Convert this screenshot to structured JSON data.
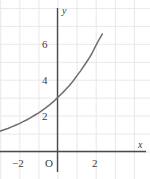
{
  "figure": {
    "corner_mark": "·",
    "background_color": "#ffffff"
  },
  "chart_data": {
    "type": "line",
    "title": "",
    "subtitle": "",
    "xlabel": "x",
    "ylabel": "y",
    "grid": true,
    "legend": null,
    "xlim": [
      -3.05,
      4.85
    ],
    "ylim": [
      -1.5,
      8.4
    ],
    "xticks": [
      -2,
      0,
      2
    ],
    "xtick_labels": [
      "−2",
      "O",
      "2"
    ],
    "yticks": [
      2,
      4,
      6
    ],
    "ytick_labels": [
      "2",
      "4",
      "6"
    ],
    "x_gridlines": [
      -3,
      -2,
      -1,
      0,
      1,
      2,
      3,
      4
    ],
    "y_gridlines": [
      0,
      1,
      2,
      3,
      4,
      5,
      6,
      7,
      8
    ],
    "curve_color": "#6e6e6e",
    "axis_color": "#4a4a4a",
    "grid_color": "#e8e8ec",
    "series": [
      {
        "name": "exponential",
        "equation": "y = 3 · 1.4^x",
        "x": [
          -3.05,
          -2.8,
          -2.6,
          -2.4,
          -2.2,
          -2.0,
          -1.8,
          -1.6,
          -1.4,
          -1.2,
          -1.0,
          -0.8,
          -0.6,
          -0.4,
          -0.2,
          0.0,
          0.2,
          0.4,
          0.6,
          0.8,
          1.0,
          1.2,
          1.4,
          1.6,
          1.8,
          2.0,
          2.2,
          2.35
        ],
        "y": [
          1.12,
          1.21,
          1.28,
          1.37,
          1.46,
          1.55,
          1.66,
          1.77,
          1.89,
          2.02,
          2.14,
          2.29,
          2.44,
          2.61,
          2.79,
          3.0,
          3.2,
          3.42,
          3.65,
          3.9,
          4.2,
          4.48,
          4.79,
          5.11,
          5.46,
          5.88,
          6.28,
          6.55
        ]
      }
    ],
    "annotations": []
  }
}
